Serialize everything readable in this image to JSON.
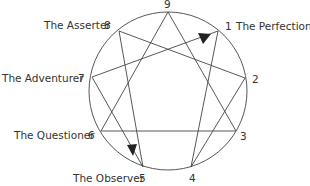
{
  "diagram": {
    "type": "enneagram",
    "circle": {
      "cx": 168,
      "cy": 91,
      "r": 79
    },
    "points": [
      {
        "n": "9",
        "x": 168,
        "y": 12,
        "label": ""
      },
      {
        "n": "1",
        "x": 218,
        "y": 31,
        "label": "The Perfectionist"
      },
      {
        "n": "2",
        "x": 245,
        "y": 78,
        "label": ""
      },
      {
        "n": "3",
        "x": 236,
        "y": 131,
        "label": ""
      },
      {
        "n": "4",
        "x": 191,
        "y": 167,
        "label": ""
      },
      {
        "n": "5",
        "x": 143,
        "y": 167,
        "label": "The Observer"
      },
      {
        "n": "6",
        "x": 101,
        "y": 131,
        "label": "The Questioner"
      },
      {
        "n": "7",
        "x": 92,
        "y": 77,
        "label": "The Adventurer"
      },
      {
        "n": "8",
        "x": 119,
        "y": 31,
        "label": "The Asserter"
      }
    ],
    "labels": {
      "p9": "9",
      "p1": "1",
      "p1_name": "The Perfectionist",
      "p2": "2",
      "p3": "3",
      "p4": "4",
      "p5": "5",
      "p5_name": "The Observer",
      "p6": "6",
      "p6_name": "The Questioner",
      "p7": "7",
      "p7_name": "The Adventurer",
      "p8": "8",
      "p8_name": "The Asserter"
    },
    "edges": [
      [
        "9",
        "3"
      ],
      [
        "3",
        "6"
      ],
      [
        "6",
        "9"
      ],
      [
        "1",
        "4"
      ],
      [
        "4",
        "2"
      ],
      [
        "2",
        "8"
      ],
      [
        "8",
        "5"
      ],
      [
        "5",
        "7"
      ],
      [
        "7",
        "1"
      ]
    ],
    "arrows": [
      {
        "on_edge": [
          "7",
          "1"
        ],
        "direction": "toward 1"
      },
      {
        "on_edge": [
          "8",
          "5"
        ],
        "direction": "toward 5"
      }
    ],
    "colors": {
      "line": "#444444",
      "text": "#333333",
      "background": "#ffffff"
    }
  }
}
